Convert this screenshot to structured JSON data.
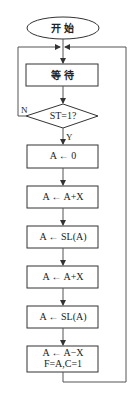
{
  "flowchart": {
    "start": {
      "label": "开始"
    },
    "wait": {
      "label": "等待"
    },
    "decision": {
      "label": "ST=1?",
      "yes_label": "Y",
      "no_label": "N"
    },
    "steps": [
      {
        "line1": "A ← 0"
      },
      {
        "line1": "A ← A+X"
      },
      {
        "line1": "A ← SL(A)"
      },
      {
        "line1": "A ← A+X"
      },
      {
        "line1": "A ← SL(A)"
      },
      {
        "line1": "A ← A−X",
        "line2": "F=A,C=1"
      }
    ],
    "colors": {
      "stroke": "#333333",
      "connector": "#555555",
      "background": "#ffffff"
    }
  }
}
